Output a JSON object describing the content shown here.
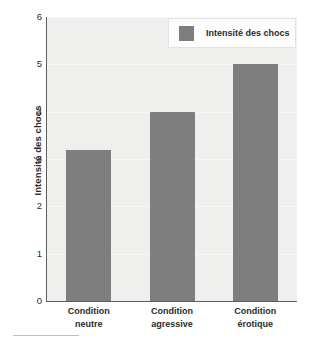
{
  "chart_data": {
    "type": "bar",
    "title": "",
    "subtitle": "",
    "xlabel": "",
    "ylabel": "Intensité des chocs",
    "categories": [
      "Condition neutre",
      "Condition agressive",
      "Condition érotique"
    ],
    "category_lines": [
      [
        "Condition",
        "neutre"
      ],
      [
        "Condition",
        "agressive"
      ],
      [
        "Condition",
        "érotique"
      ]
    ],
    "values": [
      3.2,
      4.0,
      5.0
    ],
    "series": [
      {
        "name": "Intensité des chocs",
        "values": [
          3.2,
          4.0,
          5.0
        ],
        "color": "#7e7e7e"
      }
    ],
    "ylim": [
      0,
      6
    ],
    "yticks": [
      6,
      5,
      4,
      3,
      2,
      1,
      0
    ],
    "ytick_labels": [
      "6",
      "5",
      "4",
      "3",
      "2",
      "1",
      "0"
    ],
    "grid": true,
    "legend_position": "top-right",
    "legend_entries": [
      "Intensité des chocs"
    ],
    "plot_background": "#efefee",
    "axis_color": "#5e5e5e"
  },
  "legend": {
    "label": "Intensité des chocs"
  },
  "axis": {
    "y_title": "Intensité des chocs"
  }
}
